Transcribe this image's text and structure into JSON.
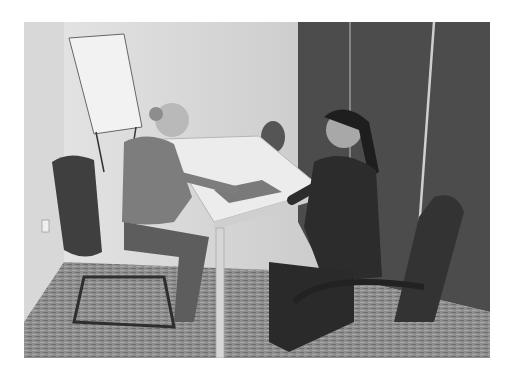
{
  "image": {
    "kind": "photograph",
    "tone": "grayscale",
    "scene": "two women seated facing each other across a white meeting table in a small office",
    "elements": [
      "flip chart easel",
      "white rectangular table",
      "office chairs",
      "dark wall panels",
      "patterned carpet",
      "wall socket"
    ]
  },
  "colors": {
    "background": "#ffffff",
    "wall": "#cdcdcd",
    "panel": "#4a4a4a",
    "carpet": "#8c8c8c",
    "table": "#e8e8e8"
  }
}
